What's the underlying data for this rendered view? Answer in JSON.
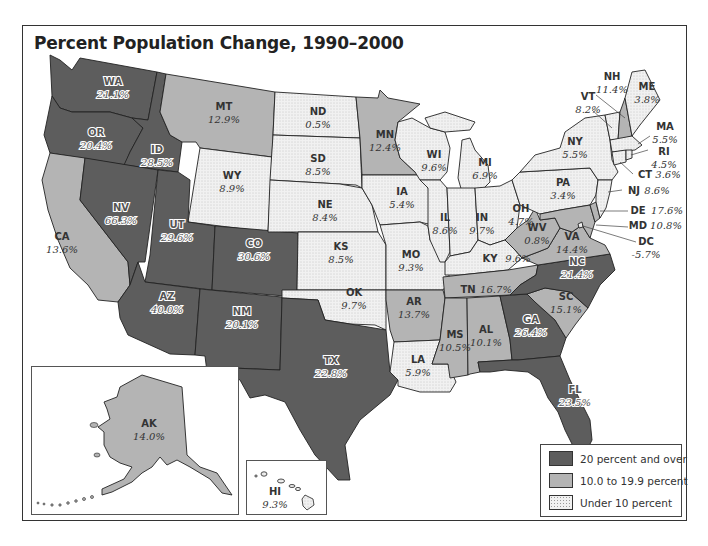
{
  "title": "Percent Population Change, 1990–2000",
  "colors": {
    "high": "#5d5d5d",
    "mid": "#b4b4b4",
    "low": "#f1f1f1",
    "dots": "#9a9a9a",
    "border": "#222222"
  },
  "legend": {
    "items": [
      {
        "class": "high",
        "label": "20 percent and over"
      },
      {
        "class": "mid",
        "label": "10.0 to 19.9 percent"
      },
      {
        "class": "low",
        "label": "Under 10 percent"
      }
    ]
  },
  "states": {
    "WA": {
      "abbr": "WA",
      "pct": "21.1%",
      "class": "high"
    },
    "OR": {
      "abbr": "OR",
      "pct": "20.4%",
      "class": "high"
    },
    "CA": {
      "abbr": "CA",
      "pct": "13.6%",
      "class": "mid"
    },
    "ID": {
      "abbr": "ID",
      "pct": "28.5%",
      "class": "high"
    },
    "NV": {
      "abbr": "NV",
      "pct": "66.3%",
      "class": "high"
    },
    "MT": {
      "abbr": "MT",
      "pct": "12.9%",
      "class": "mid"
    },
    "WY": {
      "abbr": "WY",
      "pct": "8.9%",
      "class": "low"
    },
    "UT": {
      "abbr": "UT",
      "pct": "29.6%",
      "class": "high"
    },
    "AZ": {
      "abbr": "AZ",
      "pct": "40.0%",
      "class": "high"
    },
    "CO": {
      "abbr": "CO",
      "pct": "30.6%",
      "class": "high"
    },
    "NM": {
      "abbr": "NM",
      "pct": "20.1%",
      "class": "high"
    },
    "ND": {
      "abbr": "ND",
      "pct": "0.5%",
      "class": "low"
    },
    "SD": {
      "abbr": "SD",
      "pct": "8.5%",
      "class": "low"
    },
    "NE": {
      "abbr": "NE",
      "pct": "8.4%",
      "class": "low"
    },
    "KS": {
      "abbr": "KS",
      "pct": "8.5%",
      "class": "low"
    },
    "OK": {
      "abbr": "OK",
      "pct": "9.7%",
      "class": "low"
    },
    "TX": {
      "abbr": "TX",
      "pct": "22.8%",
      "class": "high"
    },
    "MN": {
      "abbr": "MN",
      "pct": "12.4%",
      "class": "mid"
    },
    "IA": {
      "abbr": "IA",
      "pct": "5.4%",
      "class": "low"
    },
    "MO": {
      "abbr": "MO",
      "pct": "9.3%",
      "class": "low"
    },
    "AR": {
      "abbr": "AR",
      "pct": "13.7%",
      "class": "mid"
    },
    "LA": {
      "abbr": "LA",
      "pct": "5.9%",
      "class": "low"
    },
    "WI": {
      "abbr": "WI",
      "pct": "9.6%",
      "class": "low"
    },
    "IL": {
      "abbr": "IL",
      "pct": "8.6%",
      "class": "low"
    },
    "MI": {
      "abbr": "MI",
      "pct": "6.9%",
      "class": "low"
    },
    "IN": {
      "abbr": "IN",
      "pct": "9.7%",
      "class": "low"
    },
    "OH": {
      "abbr": "OH",
      "pct": "4.7%",
      "class": "low"
    },
    "KY": {
      "abbr": "KY",
      "pct": "9.6%",
      "class": "low"
    },
    "TN": {
      "abbr": "TN",
      "pct": "16.7%",
      "class": "mid"
    },
    "MS": {
      "abbr": "MS",
      "pct": "10.5%",
      "class": "mid"
    },
    "AL": {
      "abbr": "AL",
      "pct": "10.1%",
      "class": "mid"
    },
    "GA": {
      "abbr": "GA",
      "pct": "26.4%",
      "class": "high"
    },
    "FL": {
      "abbr": "FL",
      "pct": "23.5%",
      "class": "high"
    },
    "SC": {
      "abbr": "SC",
      "pct": "15.1%",
      "class": "mid"
    },
    "NC": {
      "abbr": "NC",
      "pct": "21.4%",
      "class": "high"
    },
    "VA": {
      "abbr": "VA",
      "pct": "14.4%",
      "class": "mid"
    },
    "WV": {
      "abbr": "WV",
      "pct": "0.8%",
      "class": "mid"
    },
    "PA": {
      "abbr": "PA",
      "pct": "3.4%",
      "class": "low"
    },
    "NY": {
      "abbr": "NY",
      "pct": "5.5%",
      "class": "low"
    },
    "VT": {
      "abbr": "VT",
      "pct": "8.2%",
      "class": "low"
    },
    "NH": {
      "abbr": "NH",
      "pct": "11.4%",
      "class": "mid"
    },
    "ME": {
      "abbr": "ME",
      "pct": "3.8%",
      "class": "low"
    },
    "MA": {
      "abbr": "MA",
      "pct": "5.5%",
      "class": "low"
    },
    "RI": {
      "abbr": "RI",
      "pct": "4.5%",
      "class": "low"
    },
    "CT": {
      "abbr": "CT",
      "pct": "3.6%",
      "class": "low"
    },
    "NJ": {
      "abbr": "NJ",
      "pct": "8.6%",
      "class": "low"
    },
    "DE": {
      "abbr": "DE",
      "pct": "17.6%",
      "class": "mid"
    },
    "MD": {
      "abbr": "MD",
      "pct": "10.8%",
      "class": "mid"
    },
    "DC": {
      "abbr": "DC",
      "pct": "-5.7%",
      "class": "low"
    },
    "AK": {
      "abbr": "AK",
      "pct": "14.0%",
      "class": "mid"
    },
    "HI": {
      "abbr": "HI",
      "pct": "9.3%",
      "class": "low"
    }
  }
}
